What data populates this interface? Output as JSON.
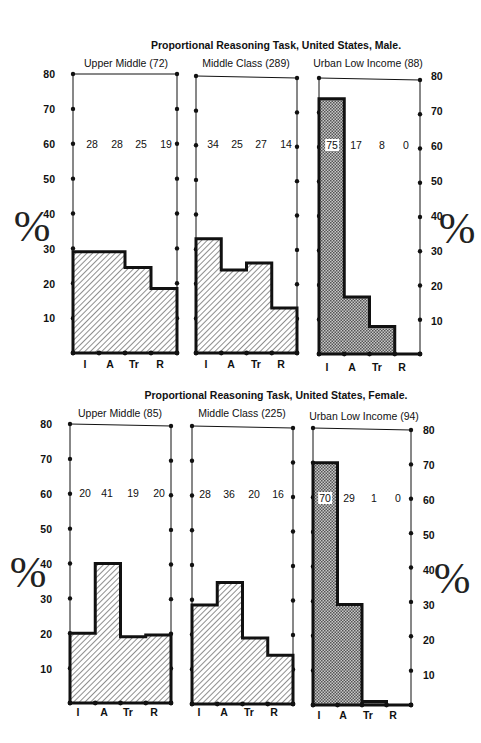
{
  "figures": [
    {
      "title": "Proportional Reasoning Task, United States, Male.",
      "panels": [
        {
          "label": "Upper Middle (72)",
          "values": [
            28,
            28,
            25,
            19
          ],
          "bars": [
            29,
            29,
            24.5,
            18.5
          ],
          "fill": "hatch"
        },
        {
          "label": "Middle Class (289)",
          "values": [
            34,
            25,
            27,
            14
          ],
          "bars": [
            33,
            24,
            26,
            13
          ],
          "fill": "hatch"
        },
        {
          "label": "Urban Low Income (88)",
          "values": [
            75,
            17,
            8,
            0
          ],
          "bars": [
            74,
            16.5,
            8,
            0
          ],
          "fill": "dots"
        }
      ]
    },
    {
      "title": "Proportional Reasoning Task, United States, Female.",
      "panels": [
        {
          "label": "Upper Middle (85)",
          "values": [
            20,
            41,
            19,
            20
          ],
          "bars": [
            20,
            40,
            19,
            19.5
          ],
          "fill": "hatch"
        },
        {
          "label": "Middle Class (225)",
          "values": [
            28,
            36,
            20,
            16
          ],
          "bars": [
            28.5,
            35,
            19,
            14
          ],
          "fill": "hatch"
        },
        {
          "label": "Urban Low Income (94)",
          "values": [
            70,
            29,
            1,
            0
          ],
          "bars": [
            70,
            29,
            1,
            0
          ],
          "fill": "dots"
        }
      ]
    }
  ],
  "axis": {
    "ylabel": "%",
    "ticks": [
      "80",
      "70",
      "60",
      "50",
      "40",
      "30",
      "20",
      "10"
    ],
    "categories": [
      "I",
      "A",
      "Tr",
      "R"
    ]
  },
  "colors": {
    "line": "#111111",
    "hatch": "#444444",
    "dots": "#555555",
    "background": "#ffffff"
  },
  "chart_data": [
    {
      "type": "bar",
      "title": "Proportional Reasoning Task, United States, Male.",
      "xlabel": "",
      "ylabel": "%",
      "ylim": [
        0,
        80
      ],
      "categories": [
        "I",
        "A",
        "Tr",
        "R"
      ],
      "series": [
        {
          "name": "Upper Middle (72)",
          "values": [
            28,
            28,
            25,
            19
          ]
        },
        {
          "name": "Middle Class (289)",
          "values": [
            34,
            25,
            27,
            14
          ]
        },
        {
          "name": "Urban Low Income (88)",
          "values": [
            75,
            17,
            8,
            0
          ]
        }
      ],
      "grid": false,
      "legend": "panel titles above each subplot"
    },
    {
      "type": "bar",
      "title": "Proportional Reasoning Task, United States, Female.",
      "xlabel": "",
      "ylabel": "%",
      "ylim": [
        0,
        80
      ],
      "categories": [
        "I",
        "A",
        "Tr",
        "R"
      ],
      "series": [
        {
          "name": "Upper Middle (85)",
          "values": [
            20,
            41,
            19,
            20
          ]
        },
        {
          "name": "Middle Class (225)",
          "values": [
            28,
            36,
            20,
            16
          ]
        },
        {
          "name": "Urban Low Income (94)",
          "values": [
            70,
            29,
            1,
            0
          ]
        }
      ],
      "grid": false,
      "legend": "panel titles above each subplot"
    }
  ]
}
